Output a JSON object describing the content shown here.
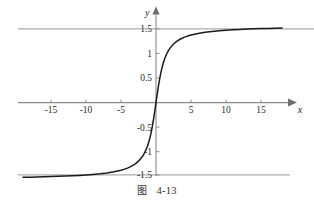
{
  "figure": {
    "caption_prefix": "图",
    "caption_number": "4-13",
    "axis_x_label": "x",
    "axis_y_label": "y",
    "curve_color": "#1a1a1a",
    "axis_color": "#8a8a8a",
    "asymptote_color": "#a8a8a8",
    "background_color": "#ffffff"
  },
  "chart_data": {
    "type": "line",
    "title": "",
    "subtitle": "",
    "xlabel": "x",
    "ylabel": "y",
    "xlim": [
      -19,
      18
    ],
    "ylim": [
      -1.75,
      1.75
    ],
    "grid": false,
    "legend": null,
    "function": "y = arctan(x)",
    "xticks": [
      -15,
      -10,
      -5,
      5,
      10,
      15
    ],
    "xtick_labels": [
      "-15",
      "-10",
      "-5",
      "5",
      "10",
      "15"
    ],
    "yticks": [
      1.5,
      1,
      0.5,
      -0.5,
      -1,
      -1.5
    ],
    "ytick_labels": [
      "1.5",
      "1",
      "0.5",
      "-0.5",
      "-1",
      "-1.5"
    ],
    "annotations": [
      {
        "type": "asymptote",
        "orientation": "horizontal",
        "value": 1.5708,
        "label": ""
      },
      {
        "type": "asymptote",
        "orientation": "horizontal",
        "value": -1.5708,
        "label": ""
      }
    ],
    "series": [
      {
        "name": "arctan(x)",
        "x": [
          -19,
          -18,
          -17,
          -16,
          -15,
          -14,
          -13,
          -12,
          -11,
          -10,
          -9,
          -8,
          -7,
          -6,
          -5,
          -4.5,
          -4,
          -3.5,
          -3,
          -2.5,
          -2,
          -1.75,
          -1.5,
          -1.25,
          -1,
          -0.875,
          -0.75,
          -0.625,
          -0.5,
          -0.375,
          -0.25,
          -0.125,
          0,
          0.125,
          0.25,
          0.375,
          0.5,
          0.625,
          0.75,
          0.875,
          1,
          1.25,
          1.5,
          1.75,
          2,
          2.5,
          3,
          3.5,
          4,
          4.5,
          5,
          6,
          7,
          8,
          9,
          10,
          11,
          12,
          13,
          14,
          15,
          16,
          17,
          18
        ],
        "y": [
          -1.5182,
          -1.5153,
          -1.5121,
          -1.5084,
          -1.5042,
          -1.4994,
          -1.494,
          -1.4876,
          -1.4801,
          -1.4711,
          -1.4601,
          -1.4464,
          -1.4289,
          -1.4056,
          -1.3734,
          -1.3521,
          -1.3258,
          -1.2925,
          -1.249,
          -1.1903,
          -1.1071,
          -1.0517,
          -0.9828,
          -0.8961,
          -0.7854,
          -0.7188,
          -0.6435,
          -0.5586,
          -0.4636,
          -0.3588,
          -0.245,
          -0.1244,
          0,
          0.1244,
          0.245,
          0.3588,
          0.4636,
          0.5586,
          0.6435,
          0.7188,
          0.7854,
          0.8961,
          0.9828,
          1.0517,
          1.1071,
          1.1903,
          1.249,
          1.2925,
          1.3258,
          1.3521,
          1.3734,
          1.4056,
          1.4289,
          1.4464,
          1.4601,
          1.4711,
          1.4801,
          1.4876,
          1.494,
          1.4994,
          1.5042,
          1.5084,
          1.5121,
          1.5153
        ],
        "color": "#1a1a1a"
      }
    ]
  }
}
